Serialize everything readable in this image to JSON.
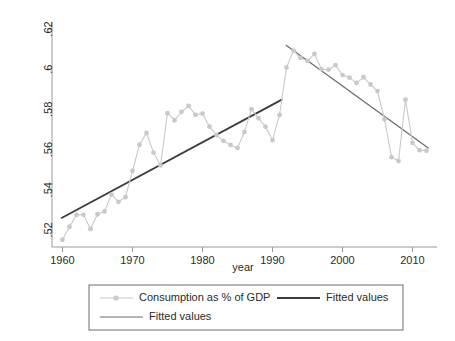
{
  "chart_data": {
    "type": "line",
    "title": "",
    "xlabel": "year",
    "ylabel": "",
    "xlim": [
      1958.5,
      2013.5
    ],
    "ylim": [
      0.5115,
      0.6235
    ],
    "grid": false,
    "legend_position": "bottom",
    "x_ticks": [
      "1960",
      "1970",
      "1980",
      "1990",
      "2000",
      "2010"
    ],
    "x_tick_values": [
      1960,
      1970,
      1980,
      1990,
      2000,
      2010
    ],
    "y_ticks": [
      ".52",
      ".54",
      ".56",
      ".58",
      ".6",
      ".62"
    ],
    "y_tick_values": [
      0.52,
      0.54,
      0.56,
      0.58,
      0.6,
      0.62
    ],
    "x": [
      1960,
      1961,
      1962,
      1963,
      1964,
      1965,
      1966,
      1967,
      1968,
      1969,
      1970,
      1971,
      1972,
      1973,
      1974,
      1975,
      1976,
      1977,
      1978,
      1979,
      1980,
      1981,
      1982,
      1983,
      1984,
      1985,
      1986,
      1987,
      1988,
      1989,
      1990,
      1991,
      1992,
      1993,
      1994,
      1995,
      1996,
      1997,
      1998,
      1999,
      2000,
      2001,
      2002,
      2003,
      2004,
      2005,
      2006,
      2007,
      2008,
      2009,
      2010,
      2011,
      2012
    ],
    "series": [
      {
        "name": "Consumption as % of GDP",
        "type": "line-marker",
        "color": "#c9c9c9",
        "values": [
          0.5151,
          0.5216,
          0.5275,
          0.5275,
          0.5205,
          0.5278,
          0.5292,
          0.5376,
          0.534,
          0.5363,
          0.5494,
          0.5624,
          0.5683,
          0.5585,
          0.5521,
          0.5781,
          0.5746,
          0.5788,
          0.5817,
          0.5773,
          0.5779,
          0.5714,
          0.5672,
          0.5643,
          0.5623,
          0.5608,
          0.5688,
          0.5801,
          0.5756,
          0.5714,
          0.5647,
          0.5772,
          0.6008,
          0.6093,
          0.6056,
          0.6041,
          0.6076,
          0.6,
          0.5998,
          0.602,
          0.5971,
          0.5958,
          0.5932,
          0.596,
          0.5924,
          0.5891,
          0.5751,
          0.5562,
          0.5543,
          0.5848,
          0.5633,
          0.5597,
          0.5594
        ]
      },
      {
        "name": "Fitted values",
        "type": "line",
        "color": "#3c3c3c",
        "segment": "1960-1991",
        "x": [
          1959.8,
          1991.4
        ],
        "values": [
          0.5258,
          0.585
        ]
      },
      {
        "name": "Fitted values",
        "type": "line",
        "color": "#6a6a6a",
        "segment": "1992-2012",
        "x": [
          1991.9,
          2012.3
        ],
        "values": [
          0.6121,
          0.5606
        ]
      }
    ],
    "legend_entries": [
      {
        "label": "Consumption as % of GDP",
        "marker": "line-with-dot",
        "color": "#c9c9c9"
      },
      {
        "label": "Fitted values",
        "marker": "thick-line",
        "color": "#3c3c3c"
      },
      {
        "label": "Fitted values",
        "marker": "line",
        "color": "#6a6a6a"
      }
    ]
  },
  "axes": {
    "x_title": "year"
  },
  "colors": {
    "series": "#c9c9c9",
    "fit_dark": "#3c3c3c",
    "fit_gray": "#6a6a6a",
    "axis": "#9a9a9a",
    "text": "#2b2b2b",
    "legend_border": "#6e6e6e",
    "background": "#ffffff"
  }
}
